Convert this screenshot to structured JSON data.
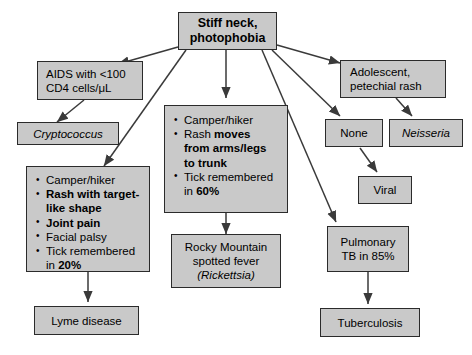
{
  "diagram": {
    "title_node": {
      "lines": [
        "Stiff neck,",
        "photophobia"
      ]
    },
    "nodes": {
      "aids": {
        "lines": [
          "AIDS with <100",
          "CD4 cells/μL"
        ]
      },
      "cryptococcus": {
        "label": "Cryptococcus"
      },
      "center_findings": {
        "bullets": [
          {
            "parts": [
              {
                "text": "Camper/hiker",
                "style": "regular"
              }
            ]
          },
          {
            "parts": [
              {
                "text": "Rash ",
                "style": "regular"
              },
              {
                "text": "moves",
                "style": "bold"
              },
              {
                "text": "from arms/legs",
                "style": "bold",
                "newline": true
              },
              {
                "text": "to trunk",
                "style": "bold",
                "newline": true
              }
            ]
          },
          {
            "parts": [
              {
                "text": "Tick remembered",
                "style": "regular"
              },
              {
                "text": "in ",
                "style": "regular",
                "newline": true
              },
              {
                "text": "60%",
                "style": "bold"
              }
            ]
          }
        ]
      },
      "lyme_findings": {
        "bullets": [
          {
            "parts": [
              {
                "text": "Camper/hiker",
                "style": "regular"
              }
            ]
          },
          {
            "parts": [
              {
                "text": "Rash with target-",
                "style": "bold"
              },
              {
                "text": "like shape",
                "style": "bold",
                "newline": true
              }
            ]
          },
          {
            "parts": [
              {
                "text": "Joint pain",
                "style": "bold"
              }
            ]
          },
          {
            "parts": [
              {
                "text": "Facial palsy",
                "style": "regular"
              }
            ]
          },
          {
            "parts": [
              {
                "text": "Tick remembered",
                "style": "regular"
              },
              {
                "text": "in ",
                "style": "regular",
                "newline": true
              },
              {
                "text": "20%",
                "style": "bold"
              }
            ]
          }
        ]
      },
      "adolescent": {
        "lines": [
          "Adolescent,",
          "petechial rash"
        ]
      },
      "none": {
        "label": "None"
      },
      "neisseria": {
        "label": "Neisseria"
      },
      "viral": {
        "label": "Viral"
      },
      "pulmonary_tb": {
        "lines": [
          "Pulmonary",
          "TB in 85%"
        ]
      },
      "rmsf": {
        "lines": [
          "Rocky Mountain",
          "spotted fever"
        ],
        "organism": "(Rickettsia)"
      },
      "lyme_disease": {
        "label": "Lyme disease"
      },
      "tuberculosis": {
        "label": "Tuberculosis"
      }
    },
    "colors": {
      "node_fill": "#c9c9c9",
      "node_border": "#2b2b2b",
      "edge": "#3a3a3a",
      "background": "#ffffff"
    }
  }
}
